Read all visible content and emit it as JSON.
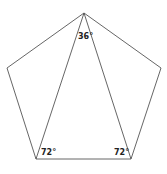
{
  "diagram": {
    "title": "",
    "shape": "regular pentagon with inscribed isosceles triangle",
    "vertices": {
      "top": [
        84,
        13
      ],
      "left": [
        7,
        68
      ],
      "right": [
        161,
        68
      ],
      "bottom_left": [
        36,
        159
      ],
      "bottom_right": [
        131,
        159
      ]
    },
    "angles": {
      "top": "36°",
      "bottom_left": "72°",
      "bottom_right": "72°"
    },
    "line_color": "#555555"
  }
}
